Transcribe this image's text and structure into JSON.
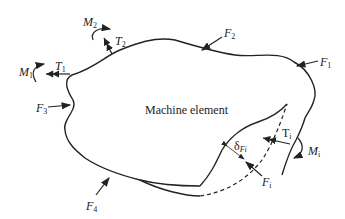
{
  "diagram": {
    "title": "Machine element",
    "labels": {
      "F1": {
        "base": "F",
        "sub": "1"
      },
      "F2": {
        "base": "F",
        "sub": "2"
      },
      "F3": {
        "base": "F",
        "sub": "3"
      },
      "F4": {
        "base": "F",
        "sub": "4"
      },
      "M1": {
        "base": "M",
        "sub": "1"
      },
      "M2": {
        "base": "M",
        "sub": "2"
      },
      "T1": {
        "base": "T",
        "sub": "1"
      },
      "T2": {
        "base": "T",
        "sub": "2"
      },
      "Ti": {
        "base": "T",
        "sub": "i"
      },
      "Mi": {
        "base": "M",
        "sub": "i"
      },
      "Fi": {
        "base": "F",
        "sub": "i"
      },
      "dFi": {
        "base": "δ",
        "sub": "Fi"
      }
    },
    "colors": {
      "stroke": "#222222",
      "background": "#ffffff"
    }
  }
}
